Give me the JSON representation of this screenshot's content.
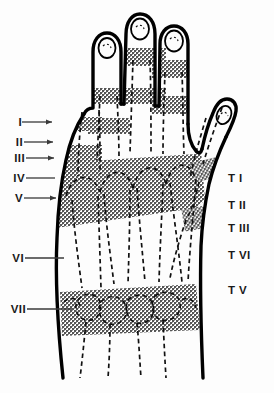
{
  "figure": {
    "colors": {
      "ink": "#000000",
      "band_fill": "#a6a6a6",
      "paper": "#fdfdfd",
      "leader": "#3a3a3a",
      "rule": "#8d8d8d"
    }
  },
  "labels": {
    "left": [
      {
        "id": "level-1",
        "text": "I",
        "x": 10,
        "y": 116,
        "leader_from": 22,
        "leader_to": 52,
        "leader_y": 122
      },
      {
        "id": "level-2",
        "text": "II",
        "x": 8,
        "y": 136,
        "leader_from": 24,
        "leader_to": 53,
        "leader_y": 142
      },
      {
        "id": "level-3",
        "text": "III",
        "x": 4,
        "y": 152,
        "leader_from": 26,
        "leader_to": 54,
        "leader_y": 158
      },
      {
        "id": "level-4",
        "text": "IV",
        "x": 6,
        "y": 172,
        "leader_from": 26,
        "leader_to": 55,
        "leader_y": 178
      },
      {
        "id": "level-5",
        "text": "V",
        "x": 10,
        "y": 192,
        "leader_from": 24,
        "leader_to": 56,
        "leader_y": 198
      },
      {
        "id": "level-6",
        "text": "VI",
        "x": 6,
        "y": 252,
        "leader_from": 25,
        "leader_to": 64,
        "leader_y": 258
      },
      {
        "id": "level-7",
        "text": "VII",
        "x": 2,
        "y": 303,
        "leader_from": 27,
        "leader_to": 72,
        "leader_y": 309
      }
    ],
    "right": [
      {
        "id": "thumb-level-1",
        "text": "T I",
        "x": 228,
        "y": 172
      },
      {
        "id": "thumb-level-2",
        "text": "T II",
        "x": 228,
        "y": 199
      },
      {
        "id": "thumb-level-3",
        "text": "T III",
        "x": 228,
        "y": 222
      },
      {
        "id": "thumb-level-6",
        "text": "T VI",
        "x": 228,
        "y": 249
      },
      {
        "id": "thumb-level-5",
        "text": "T V",
        "x": 228,
        "y": 284
      }
    ]
  }
}
